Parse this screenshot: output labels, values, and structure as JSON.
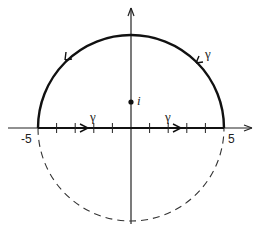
{
  "diagram": {
    "labels": {
      "left_bound": "-5",
      "right_bound": "5",
      "point_i": "i",
      "gamma_arc": "γ",
      "gamma_axis_left": "γ",
      "gamma_axis_right": "γ"
    },
    "radius": 5,
    "ticks": [
      -4,
      -3,
      -2,
      -1,
      1,
      2,
      3,
      4
    ],
    "colors": {
      "stroke": "#1a1a1a",
      "background": "#ffffff"
    }
  }
}
